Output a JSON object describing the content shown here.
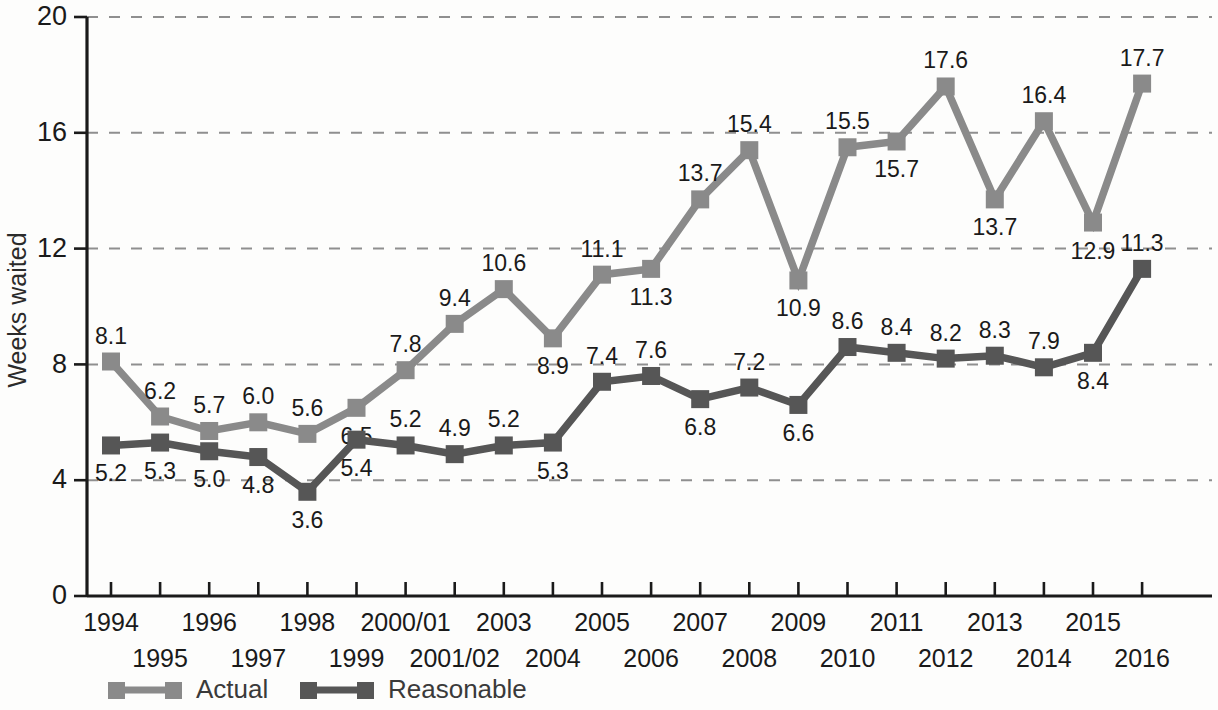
{
  "chart_data": {
    "type": "line",
    "title": "",
    "subtitle": "",
    "xlabel": "",
    "ylabel": "Weeks waited",
    "ylim": [
      0,
      20
    ],
    "yticks": [
      0,
      4,
      8,
      12,
      16,
      20
    ],
    "ytick_labels": [
      "0",
      "4",
      "8",
      "12",
      "16",
      "20"
    ],
    "grid": true,
    "grid_axis": "y",
    "grid_style": "dashed",
    "legend_position": "bottom-left",
    "x": [
      "1994",
      "1995",
      "1996",
      "1997",
      "1998",
      "1999",
      "2000/01",
      "2001/02",
      "2003",
      "2004",
      "2005",
      "2006",
      "2007",
      "2008",
      "2009",
      "2010",
      "2011",
      "2012",
      "2013",
      "2014",
      "2015",
      "2016"
    ],
    "categories": [
      "1994",
      "1995",
      "1996",
      "1997",
      "1998",
      "1999",
      "2000/01",
      "2001/02",
      "2003",
      "2004",
      "2005",
      "2006",
      "2007",
      "2008",
      "2009",
      "2010",
      "2011",
      "2012",
      "2013",
      "2014",
      "2015",
      "2016"
    ],
    "series": [
      {
        "name": "Actual",
        "color": "#8a8a8a",
        "values": [
          8.1,
          6.2,
          5.7,
          6.0,
          5.6,
          6.5,
          7.8,
          9.4,
          10.6,
          8.9,
          11.1,
          11.3,
          13.7,
          15.4,
          10.9,
          15.5,
          15.7,
          17.6,
          13.7,
          16.4,
          12.9,
          17.7
        ],
        "label_positions": [
          "above",
          "above",
          "above",
          "above",
          "above",
          "below",
          "above",
          "above",
          "above",
          "below",
          "above",
          "below",
          "above",
          "above",
          "below",
          "above",
          "below",
          "above",
          "below",
          "above",
          "below",
          "above"
        ]
      },
      {
        "name": "Reasonable",
        "color": "#565656",
        "values": [
          5.2,
          5.3,
          5.0,
          4.8,
          3.6,
          5.4,
          5.2,
          4.9,
          5.2,
          5.3,
          7.4,
          7.6,
          6.8,
          7.2,
          6.6,
          8.6,
          8.4,
          8.2,
          8.3,
          7.9,
          8.4,
          11.3
        ],
        "label_positions": [
          "below",
          "below",
          "below",
          "below",
          "below",
          "below",
          "above",
          "above",
          "above",
          "below",
          "above",
          "above",
          "below",
          "above",
          "below",
          "above",
          "above",
          "above",
          "above",
          "above",
          "below",
          "above"
        ]
      }
    ]
  },
  "legend": {
    "items": [
      {
        "label": "Actual",
        "color": "#8a8a8a"
      },
      {
        "label": "Reasonable",
        "color": "#565656"
      }
    ]
  },
  "axes": {
    "y_title": "Weeks waited"
  }
}
